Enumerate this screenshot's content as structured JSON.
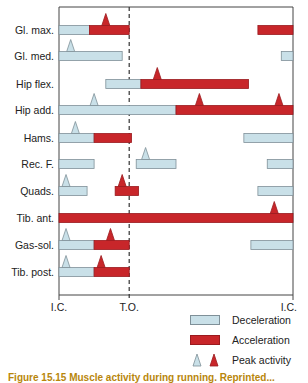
{
  "chart_data": {
    "type": "gantt",
    "title": "",
    "x_axis": {
      "ticks": [
        {
          "label": "I.C.",
          "position": 0.0
        },
        {
          "label": "T.O.",
          "position": 0.3
        },
        {
          "label": "I.C.",
          "position": 1.0
        }
      ],
      "xlim": [
        0,
        1
      ],
      "reference_line": {
        "label": "T.O.",
        "position": 0.3,
        "style": "dashed"
      }
    },
    "rows": [
      {
        "label": "Gl. max.",
        "segments": [
          {
            "type": "deceleration",
            "start": 0.0,
            "end": 0.13
          },
          {
            "type": "acceleration",
            "start": 0.13,
            "end": 0.3
          },
          {
            "type": "acceleration",
            "start": 0.85,
            "end": 1.0
          }
        ],
        "peaks": [
          {
            "type": "acceleration",
            "at": 0.2
          }
        ]
      },
      {
        "label": "Gl. med.",
        "segments": [
          {
            "type": "deceleration",
            "start": 0.0,
            "end": 0.27
          },
          {
            "type": "deceleration",
            "start": 0.95,
            "end": 1.0
          }
        ],
        "peaks": [
          {
            "type": "deceleration",
            "at": 0.05
          }
        ]
      },
      {
        "label": "Hip flex.",
        "segments": [
          {
            "type": "deceleration",
            "start": 0.2,
            "end": 0.35
          },
          {
            "type": "acceleration",
            "start": 0.35,
            "end": 0.81
          }
        ],
        "peaks": [
          {
            "type": "acceleration",
            "at": 0.42
          }
        ]
      },
      {
        "label": "Hip add.",
        "segments": [
          {
            "type": "deceleration",
            "start": 0.0,
            "end": 0.5
          },
          {
            "type": "acceleration",
            "start": 0.5,
            "end": 1.0
          }
        ],
        "peaks": [
          {
            "type": "deceleration",
            "at": 0.15
          },
          {
            "type": "acceleration",
            "at": 0.6
          },
          {
            "type": "acceleration",
            "at": 0.94
          }
        ]
      },
      {
        "label": "Hams.",
        "segments": [
          {
            "type": "deceleration",
            "start": 0.0,
            "end": 0.15
          },
          {
            "type": "acceleration",
            "start": 0.15,
            "end": 0.31
          },
          {
            "type": "deceleration",
            "start": 0.79,
            "end": 1.0
          }
        ],
        "peaks": [
          {
            "type": "deceleration",
            "at": 0.07
          }
        ]
      },
      {
        "label": "Rec. F.",
        "segments": [
          {
            "type": "deceleration",
            "start": 0.0,
            "end": 0.15
          },
          {
            "type": "deceleration",
            "start": 0.33,
            "end": 0.5
          },
          {
            "type": "deceleration",
            "start": 0.89,
            "end": 1.0
          }
        ],
        "peaks": [
          {
            "type": "deceleration",
            "at": 0.37
          }
        ]
      },
      {
        "label": "Quads.",
        "segments": [
          {
            "type": "deceleration",
            "start": 0.0,
            "end": 0.12
          },
          {
            "type": "acceleration",
            "start": 0.24,
            "end": 0.34
          },
          {
            "type": "deceleration",
            "start": 0.85,
            "end": 1.0
          }
        ],
        "peaks": [
          {
            "type": "deceleration",
            "at": 0.03
          },
          {
            "type": "acceleration",
            "at": 0.27
          }
        ]
      },
      {
        "label": "Tib. ant.",
        "segments": [
          {
            "type": "acceleration",
            "start": 0.0,
            "end": 1.0
          }
        ],
        "peaks": [
          {
            "type": "acceleration",
            "at": 0.92
          }
        ]
      },
      {
        "label": "Gas-sol.",
        "segments": [
          {
            "type": "deceleration",
            "start": 0.0,
            "end": 0.15
          },
          {
            "type": "acceleration",
            "start": 0.15,
            "end": 0.3
          },
          {
            "type": "deceleration",
            "start": 0.82,
            "end": 1.0
          }
        ],
        "peaks": [
          {
            "type": "deceleration",
            "at": 0.03
          },
          {
            "type": "acceleration",
            "at": 0.22
          }
        ]
      },
      {
        "label": "Tib. post.",
        "segments": [
          {
            "type": "deceleration",
            "start": 0.0,
            "end": 0.15
          },
          {
            "type": "acceleration",
            "start": 0.15,
            "end": 0.3
          }
        ],
        "peaks": [
          {
            "type": "deceleration",
            "at": 0.03
          },
          {
            "type": "acceleration",
            "at": 0.18
          }
        ]
      }
    ],
    "legend": [
      {
        "label": "Deceleration",
        "kind": "bar",
        "color": "#c9e0e8"
      },
      {
        "label": "Acceleration",
        "kind": "bar",
        "color": "#c8262a"
      },
      {
        "label": "Peak activity",
        "kind": "triangles",
        "colors": [
          "#c9e0e8",
          "#c8262a"
        ]
      }
    ],
    "legend_position": "bottom-right",
    "grid": false
  },
  "colors": {
    "deceleration": "#c9e0e8",
    "deceleration_border": "#7f9098",
    "acceleration": "#c8262a",
    "acceleration_border": "#9a1a1e",
    "axis": "#444444",
    "caption": "#b8860b"
  },
  "legend": {
    "deceleration_label": "Deceleration",
    "acceleration_label": "Acceleration",
    "peak_label": "Peak activity"
  },
  "caption": {
    "text": "Figure 15.15  Muscle activity during running. Reprinted..."
  }
}
